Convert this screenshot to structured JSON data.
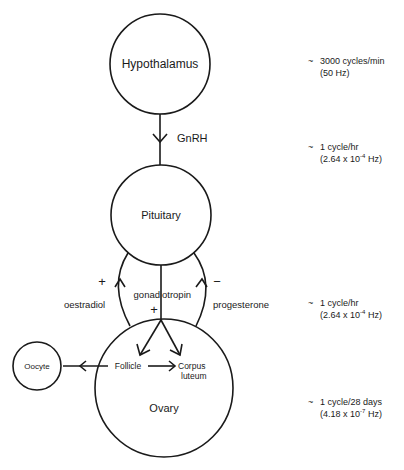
{
  "nodes": {
    "hypothalamus": {
      "label": "Hypothalamus"
    },
    "pituitary": {
      "label": "Pituitary"
    },
    "ovary": {
      "label": "Ovary"
    },
    "oocyte": {
      "label": "Oocyte"
    },
    "follicle": {
      "label": "Follicle"
    },
    "corpus_luteum": {
      "line1": "Corpus",
      "line2": "luteum"
    }
  },
  "edges": {
    "gnrh": {
      "label": "GnRH"
    },
    "gonadotropin": {
      "label_part1": "gonad",
      "label_part2": "otropin",
      "sign": "+"
    },
    "oestradiol": {
      "label": "oestradiol",
      "sign": "+"
    },
    "progesterone": {
      "label": "progesterone",
      "sign": "−"
    }
  },
  "frequencies": [
    {
      "tilde": "~",
      "line1": "3000 cycles/min",
      "line2": "(50 Hz)"
    },
    {
      "tilde": "~",
      "line1": "1 cycle/hr",
      "line2_base": "(2.64 x 10",
      "line2_exp": "-4",
      "line2_unit": " Hz)"
    },
    {
      "tilde": "~",
      "line1": "1 cycle/hr",
      "line2_base": "(2.64 x 10",
      "line2_exp": "-4",
      "line2_unit": " Hz)"
    },
    {
      "tilde": "~",
      "line1": "1 cycle/28 days",
      "line2_base": "(4.18 x 10",
      "line2_exp": "-7",
      "line2_unit": " Hz)"
    }
  ]
}
